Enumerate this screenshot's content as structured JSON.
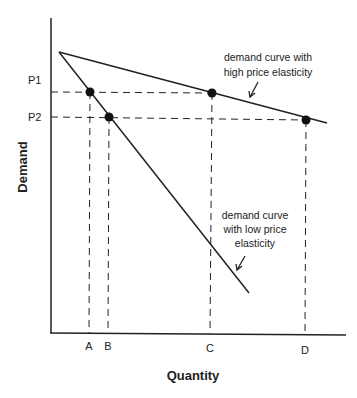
{
  "diagram": {
    "y_axis": {
      "label": "Demand",
      "ticks": [
        "P1",
        "P2"
      ]
    },
    "x_axis": {
      "label": "Quantity",
      "ticks": [
        "A",
        "B",
        "C",
        "D"
      ]
    },
    "curves": [
      {
        "name": "high-elasticity",
        "annotation_lines": [
          "demand curve with",
          "high price elasticity"
        ],
        "points": [
          {
            "label": "C",
            "price": "P1"
          },
          {
            "label": "D",
            "price": "P2"
          }
        ]
      },
      {
        "name": "low-elasticity",
        "annotation_lines": [
          "demand curve",
          "with low price",
          "elasticity"
        ],
        "points": [
          {
            "label": "A",
            "price": "P1"
          },
          {
            "label": "B",
            "price": "P2"
          }
        ]
      }
    ],
    "colors": {
      "line": "#222222",
      "background": "#ffffff"
    }
  }
}
